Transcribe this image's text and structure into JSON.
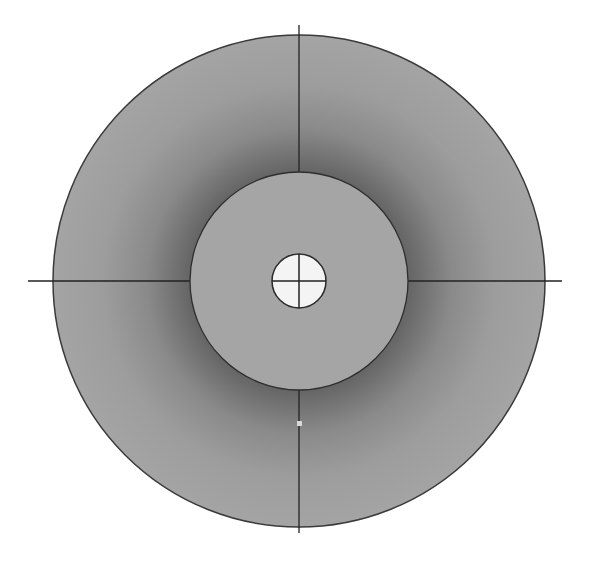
{
  "diagram": {
    "type": "concentric-circles-crosshair",
    "canvas": {
      "width": 591,
      "height": 562,
      "background": "#ffffff"
    },
    "center": {
      "x": 299,
      "y": 281
    },
    "outer_ring": {
      "radius": 246,
      "color_edge": "#a3a3a3",
      "color_shadow": "#6a6a6a",
      "stroke": "#3a3a3a"
    },
    "middle_disc": {
      "radius": 109,
      "color": "#a5a5a5",
      "stroke": "#2e2e2e"
    },
    "center_hole": {
      "radius": 27,
      "color": "#f4f4f4",
      "stroke": "#2a2a2a"
    },
    "crosshair": {
      "color": "#222222",
      "horizontal": {
        "x1": 28,
        "x2": 562,
        "y": 281
      },
      "vertical": {
        "x": 299,
        "y1": 25,
        "y2": 533
      }
    },
    "marker": {
      "x": 299,
      "y": 423,
      "size": 5,
      "color": "#d8d8d8"
    }
  }
}
